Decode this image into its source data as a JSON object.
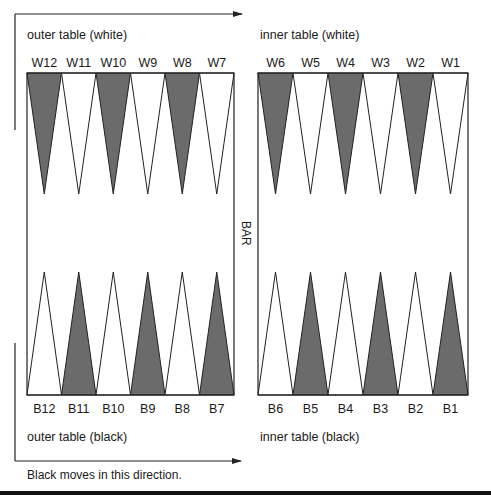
{
  "colors": {
    "dark_point": "#6b6b6b",
    "light_point": "#ffffff",
    "line": "#222222"
  },
  "labels": {
    "outer_white": "outer table (white)",
    "inner_white": "inner table (white)",
    "outer_black": "outer table (black)",
    "inner_black": "inner table (black)",
    "bar": "BAR",
    "direction_note": "Black moves in this direction."
  },
  "top_points": [
    {
      "label": "W12",
      "shade": "dark"
    },
    {
      "label": "W11",
      "shade": "light"
    },
    {
      "label": "W10",
      "shade": "dark"
    },
    {
      "label": "W9",
      "shade": "light"
    },
    {
      "label": "W8",
      "shade": "dark"
    },
    {
      "label": "W7",
      "shade": "light"
    },
    {
      "label": "W6",
      "shade": "dark"
    },
    {
      "label": "W5",
      "shade": "light"
    },
    {
      "label": "W4",
      "shade": "dark"
    },
    {
      "label": "W3",
      "shade": "light"
    },
    {
      "label": "W2",
      "shade": "dark"
    },
    {
      "label": "W1",
      "shade": "light"
    }
  ],
  "bottom_points": [
    {
      "label": "B12",
      "shade": "light"
    },
    {
      "label": "B11",
      "shade": "dark"
    },
    {
      "label": "B10",
      "shade": "light"
    },
    {
      "label": "B9",
      "shade": "dark"
    },
    {
      "label": "B8",
      "shade": "light"
    },
    {
      "label": "B7",
      "shade": "dark"
    },
    {
      "label": "B6",
      "shade": "light"
    },
    {
      "label": "B5",
      "shade": "dark"
    },
    {
      "label": "B4",
      "shade": "light"
    },
    {
      "label": "B3",
      "shade": "dark"
    },
    {
      "label": "B2",
      "shade": "light"
    },
    {
      "label": "B1",
      "shade": "dark"
    }
  ]
}
